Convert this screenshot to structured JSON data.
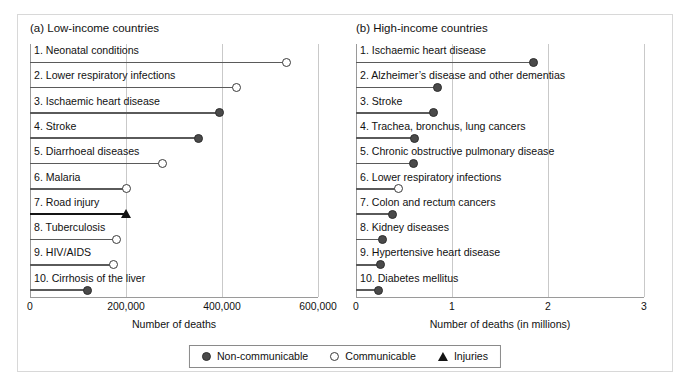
{
  "figure": {
    "background": "#ffffff",
    "frame_color": "#d8d8d8"
  },
  "legend": {
    "position": "bottom-center",
    "items": [
      {
        "label": "Non-communicable",
        "icon": "filled-circle",
        "color": "#4a4a4a",
        "key": "nc"
      },
      {
        "label": "Communicable",
        "icon": "open-circle",
        "color": "#ffffff",
        "key": "cm"
      },
      {
        "label": "Injuries",
        "icon": "filled-triangle",
        "color": "#141414",
        "key": "inj"
      }
    ]
  },
  "chart_data": [
    {
      "type": "bar",
      "panel": "a",
      "title": "(a) Low-income countries",
      "xlabel": "Number of deaths",
      "ylabel": "",
      "xlim": [
        0,
        600000
      ],
      "xticks": [
        0,
        200000,
        400000,
        600000
      ],
      "xticklabels": [
        "0",
        "200,000",
        "400,000",
        "600,000"
      ],
      "grid": "vertical",
      "categories": [
        "1. Neonatal conditions",
        "2. Lower respiratory infections",
        "3. Ischaemic heart disease",
        "4. Stroke",
        "5. Diarrhoeal diseases",
        "6. Malaria",
        "7. Road injury",
        "8. Tuberculosis",
        "9. HIV/AIDS",
        "10. Cirrhosis of the liver"
      ],
      "values": [
        535000,
        430000,
        395000,
        350000,
        277000,
        202000,
        200000,
        181000,
        173000,
        120000
      ],
      "groups": [
        "cm",
        "cm",
        "nc",
        "nc",
        "cm",
        "cm",
        "inj",
        "cm",
        "cm",
        "nc"
      ]
    },
    {
      "type": "bar",
      "panel": "b",
      "title": "(b) High-income countries",
      "xlabel": "Number of deaths (in millions)",
      "ylabel": "",
      "xlim": [
        0,
        3
      ],
      "xticks": [
        0,
        1,
        2,
        3
      ],
      "xticklabels": [
        "0",
        "1",
        "2",
        "3"
      ],
      "grid": "vertical",
      "categories": [
        "1. Ischaemic heart disease",
        "2. Alzheimer’s disease and other dementias",
        "3. Stroke",
        "4. Trachea, bronchus, lung cancers",
        "5. Chronic obstructive pulmonary disease",
        "6. Lower respiratory infections",
        "7. Colon and rectum cancers",
        "8. Kidney diseases",
        "9. Hypertensive heart disease",
        "10. Diabetes mellitus"
      ],
      "values": [
        1.85,
        0.85,
        0.81,
        0.61,
        0.6,
        0.44,
        0.38,
        0.28,
        0.25,
        0.23
      ],
      "groups": [
        "nc",
        "nc",
        "nc",
        "nc",
        "nc",
        "cm",
        "nc",
        "nc",
        "nc",
        "nc"
      ]
    }
  ]
}
